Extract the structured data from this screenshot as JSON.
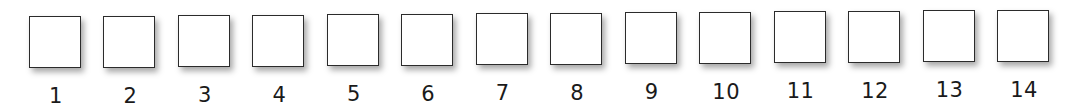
{
  "sequence": {
    "boxes": [
      {
        "label": "1",
        "value": ""
      },
      {
        "label": "2",
        "value": ""
      },
      {
        "label": "3",
        "value": ""
      },
      {
        "label": "4",
        "value": ""
      },
      {
        "label": "5",
        "value": ""
      },
      {
        "label": "6",
        "value": ""
      },
      {
        "label": "7",
        "value": ""
      },
      {
        "label": "8",
        "value": ""
      },
      {
        "label": "9",
        "value": ""
      },
      {
        "label": "10",
        "value": ""
      },
      {
        "label": "11",
        "value": ""
      },
      {
        "label": "12",
        "value": ""
      },
      {
        "label": "13",
        "value": ""
      },
      {
        "label": "14",
        "value": ""
      }
    ],
    "border_color": "#2b2b2b",
    "label_color": "#1a1a1a"
  }
}
